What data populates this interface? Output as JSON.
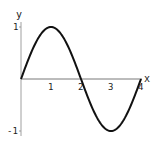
{
  "chart_data": {
    "type": "line",
    "title": "",
    "xlabel": "x",
    "ylabel": "y",
    "xlim": [
      0,
      4
    ],
    "ylim": [
      -1,
      1
    ],
    "grid": false,
    "x_ticks": [
      "1",
      "2",
      "3",
      "4"
    ],
    "y_ticks": [
      "1",
      "-1"
    ],
    "series": [
      {
        "name": "sin(pi x / 2)",
        "x": [
          0,
          0.5,
          1,
          1.5,
          2,
          2.5,
          3,
          3.5,
          4
        ],
        "values": [
          0,
          0.707,
          1,
          0.707,
          0,
          -0.707,
          -1,
          -0.707,
          0
        ]
      }
    ]
  },
  "axes": {
    "xlabel": "x",
    "ylabel": "y",
    "x_tick_labels": [
      "1",
      "2",
      "3",
      "4"
    ],
    "y_tick_top": "1",
    "y_tick_bottom": "-1"
  }
}
